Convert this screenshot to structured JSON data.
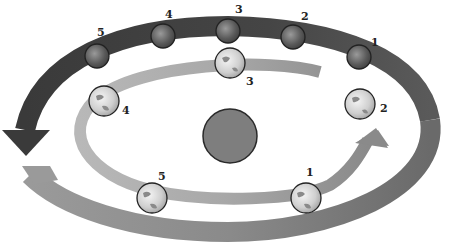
{
  "diagram": {
    "colors": {
      "background": "#ffffff",
      "outer_orbit_dark": "#3c3c3c",
      "outer_orbit_light": "#8a8a8a",
      "inner_orbit_light": "#c8c8c8",
      "inner_orbit_mid": "#9a9a9a",
      "sun": "#7a7a7a",
      "label": "#222222"
    },
    "sun": {
      "label": ""
    },
    "outer_planets": [
      {
        "label": "1",
        "x": 359,
        "y": 57
      },
      {
        "label": "2",
        "x": 293,
        "y": 37
      },
      {
        "label": "3",
        "x": 228,
        "y": 31
      },
      {
        "label": "4",
        "x": 163,
        "y": 36
      },
      {
        "label": "5",
        "x": 97,
        "y": 57
      }
    ],
    "inner_planets": [
      {
        "label": "1",
        "x": 306,
        "y": 196
      },
      {
        "label": "2",
        "x": 360,
        "y": 104
      },
      {
        "label": "3",
        "x": 230,
        "y": 63
      },
      {
        "label": "4",
        "x": 104,
        "y": 101
      },
      {
        "label": "5",
        "x": 152,
        "y": 196
      }
    ]
  }
}
